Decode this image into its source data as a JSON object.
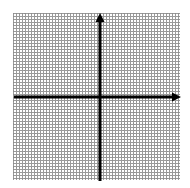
{
  "figure": {
    "title": "",
    "background_color": "#ffffff",
    "width": 190,
    "height": 188
  },
  "grid": {
    "style": "dotted",
    "color": "#8d8d8d",
    "cell_size_px": 11,
    "columns": 15,
    "rows": 15,
    "left_px": 13,
    "top_px": 13,
    "width_px": 167,
    "height_px": 167,
    "visible": true
  },
  "axes": {
    "color": "#000000",
    "line_width_px": 3,
    "origin": {
      "x_px": 100,
      "y_px": 97
    },
    "x_axis": {
      "name": "x-axis",
      "start_px": 14,
      "end_px": 181,
      "arrow_start": false,
      "arrow_end": true,
      "label": "",
      "tick_labels": []
    },
    "y_axis": {
      "name": "y-axis",
      "start_px": 13,
      "end_px": 181,
      "arrow_start": true,
      "arrow_end": false,
      "label": "",
      "tick_labels": []
    }
  },
  "chart_data": {
    "type": "scatter",
    "title": "",
    "subtitle": "",
    "xlabel": "",
    "ylabel": "",
    "xlim": [
      -8,
      7
    ],
    "ylim": [
      -7,
      8
    ],
    "xticks": [],
    "yticks": [],
    "grid": true,
    "grid_style": "dotted",
    "legend": null,
    "legend_position": "none",
    "annotations": [],
    "series": [
      {
        "name": "empty",
        "x": [],
        "y": [],
        "values": []
      }
    ]
  }
}
